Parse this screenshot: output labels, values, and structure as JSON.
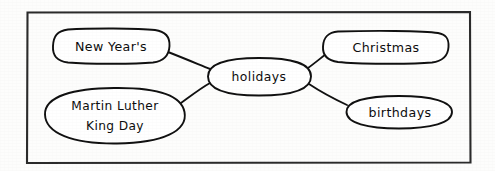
{
  "diagram": {
    "type": "concept-map",
    "title_text": "",
    "frame": {
      "present": true,
      "color": "#2b2b2b"
    },
    "ink_color": "#111111",
    "paper_color": "#fdfdfc",
    "center_node": {
      "id": "holidays",
      "label": "holidays",
      "shape": "ellipse"
    },
    "nodes": [
      {
        "id": "new-years",
        "label": "New Year's",
        "shape": "rounded-rectangle",
        "position": "top-left"
      },
      {
        "id": "martin-luther-king-day",
        "label_line1": "Martin Luther",
        "label_line2": "King Day",
        "label": "Martin Luther King Day",
        "shape": "ellipse",
        "position": "bottom-left"
      },
      {
        "id": "christmas",
        "label": "Christmas",
        "shape": "rounded-rectangle",
        "position": "top-right"
      },
      {
        "id": "birthdays",
        "label": "birthdays",
        "shape": "ellipse",
        "position": "bottom-right"
      }
    ],
    "connections": [
      {
        "from": "holidays",
        "to": "new-years"
      },
      {
        "from": "holidays",
        "to": "martin-luther-king-day"
      },
      {
        "from": "holidays",
        "to": "christmas"
      },
      {
        "from": "holidays",
        "to": "birthdays"
      }
    ]
  }
}
